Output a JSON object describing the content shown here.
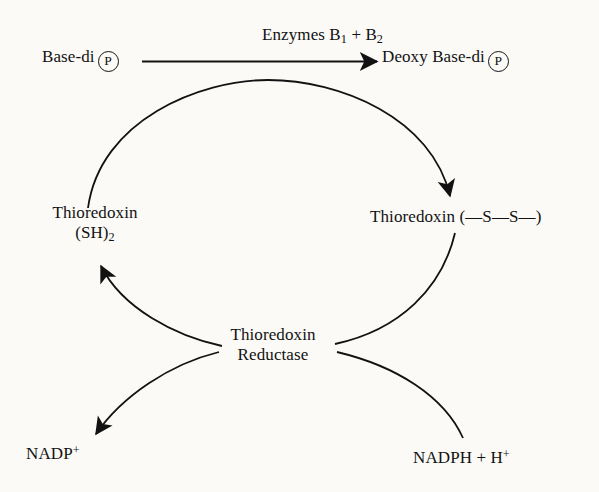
{
  "diagram": {
    "background_color": "#fbfaf7",
    "ink_color": "#121212",
    "nodes": {
      "substrate": {
        "text": "Base-di",
        "group_symbol": "P",
        "group_symbol_style": "circled"
      },
      "product": {
        "text": "Deoxy Base-di",
        "group_symbol": "P",
        "group_symbol_style": "circled"
      },
      "enzyme_label": {
        "prefix": "Enzymes B",
        "sub1": "1",
        "joiner": " + B",
        "sub2": "2"
      },
      "thioredoxin_reduced": {
        "line1": "Thioredoxin",
        "line2_prefix": "(SH)",
        "line2_sub": "2"
      },
      "thioredoxin_oxidized": {
        "text": "Thioredoxin (—S—S—)"
      },
      "thioredoxin_reductase": {
        "line1": "Thioredoxin",
        "line2": "Reductase"
      },
      "nadp_plus": {
        "text": "NADP",
        "charge": "+"
      },
      "nadph_h_plus": {
        "text": "NADPH + H",
        "charge": "+"
      }
    },
    "edges": [
      {
        "name": "substrate-to-product",
        "shape": "straight",
        "arrowhead": true,
        "label": "Enzymes B1 + B2"
      },
      {
        "name": "reduced-thioredoxin-to-oxidized-thioredoxin",
        "shape": "arc-over-top",
        "arrowhead": true
      },
      {
        "name": "reductase-to-reduced-thioredoxin",
        "shape": "arc-up-left",
        "arrowhead": true
      },
      {
        "name": "oxidized-thioredoxin-to-reductase",
        "shape": "arc-down-left",
        "arrowhead": false
      },
      {
        "name": "reductase-to-nadp-plus",
        "shape": "arc-down-left",
        "arrowhead": true
      },
      {
        "name": "nadph-to-reductase",
        "shape": "arc-up-left",
        "arrowhead": false
      }
    ]
  }
}
